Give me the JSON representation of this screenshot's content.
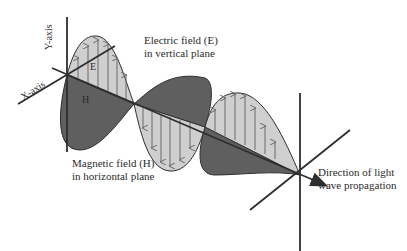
{
  "diagram": {
    "labels": {
      "y_axis": "Y-axis",
      "x_axis": "X-axis",
      "e_short": "E",
      "h_short": "H",
      "electric_line1": "Electric field (E)",
      "electric_line2": "in vertical plane",
      "magnetic_line1": "Magnetic field (H)",
      "magnetic_line2": "in horizontal plane",
      "direction_line1": "Direction of light",
      "direction_line2": "wave propagation"
    },
    "colors": {
      "electric_fill": "#cfcfcf",
      "magnetic_fill": "#5f5f5f",
      "line": "#2e2e2e",
      "arrow": "#6a6a6a",
      "text": "#2b2b2b"
    }
  }
}
